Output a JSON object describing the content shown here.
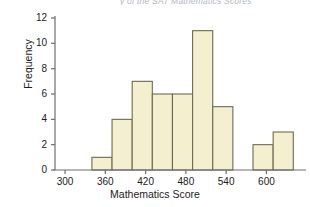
{
  "figure": {
    "caption_cutoff": "y of the SAT Mathematics Scores",
    "ylabel": "Frequency",
    "xlabel": "Mathematics Score"
  },
  "chart_data": {
    "type": "bar",
    "title": "",
    "subtitle": "",
    "xlabel": "Mathematics Score",
    "ylabel": "Frequency",
    "xlim": [
      285,
      650
    ],
    "ylim": [
      0,
      12
    ],
    "grid": false,
    "legend": null,
    "bin_width": 30,
    "bins": [
      {
        "left": 340,
        "right": 370,
        "frequency": 1
      },
      {
        "left": 370,
        "right": 400,
        "frequency": 4
      },
      {
        "left": 400,
        "right": 430,
        "frequency": 7
      },
      {
        "left": 430,
        "right": 460,
        "frequency": 6
      },
      {
        "left": 460,
        "right": 490,
        "frequency": 6
      },
      {
        "left": 490,
        "right": 520,
        "frequency": 11
      },
      {
        "left": 520,
        "right": 550,
        "frequency": 5
      },
      {
        "left": 580,
        "right": 610,
        "frequency": 2
      },
      {
        "left": 610,
        "right": 640,
        "frequency": 3
      }
    ],
    "categories": [
      "340-370",
      "370-400",
      "400-430",
      "430-460",
      "460-490",
      "490-520",
      "520-550",
      "580-610",
      "610-640"
    ],
    "values": [
      1,
      4,
      7,
      6,
      6,
      11,
      5,
      2,
      3
    ],
    "xticks": [
      300,
      360,
      420,
      480,
      540,
      600
    ],
    "xtick_labels": [
      "300",
      "360",
      "420",
      "480",
      "540",
      "600"
    ],
    "yticks": [
      0,
      2,
      4,
      6,
      8,
      10,
      12
    ],
    "ytick_labels": [
      "0",
      "2",
      "4",
      "6",
      "8",
      "10",
      "12"
    ],
    "bar_fill_color": "#F4EFCF",
    "bar_edge_color": "#6b6a55",
    "axis_color": "#6e6e6e"
  }
}
